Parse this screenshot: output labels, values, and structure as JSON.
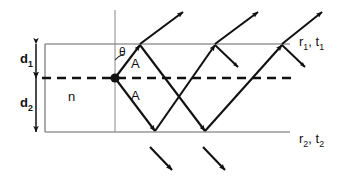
{
  "figure": {
    "type": "optics-ray-diagram",
    "colors": {
      "ink": "#111111",
      "line": "#555555",
      "background": "#ffffff"
    }
  },
  "labels": {
    "d1": "d",
    "d1_sub": "1",
    "d2": "d",
    "d2_sub": "2",
    "n": "n",
    "theta": "θ",
    "amplitude_upper": "A",
    "amplitude_lower": "A",
    "top_interface": "r",
    "top_interface_sub": "1",
    "top_interface_2": "t",
    "top_interface_2_sub": "1",
    "top_interface_sep": ", ",
    "bottom_interface": "r",
    "bottom_interface_sub": "2",
    "bottom_interface_2": "t",
    "bottom_interface_2_sub": "2",
    "bottom_interface_sep": ", "
  },
  "geometry": {
    "top_interface_y": 44,
    "median_line_y": 78,
    "bottom_interface_y": 132,
    "interface_x_start": 45,
    "interface_x_end": 290,
    "dashed_x_start": 42,
    "dashed_x_end": 295,
    "vertical_axis_x": 115,
    "vertical_axis_y_top": 10,
    "vertical_axis_y_bottom": 132,
    "source_point_x": 115,
    "source_point_y": 78,
    "dimension_arrow_x": 36,
    "top_hit_points_x": [
      140,
      215,
      282
    ],
    "bottom_hit_points_x": [
      155,
      205
    ],
    "d1_value": 34,
    "d2_value": 54
  }
}
